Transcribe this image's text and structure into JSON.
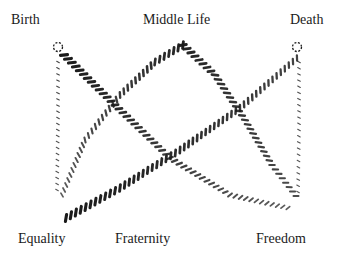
{
  "labels": {
    "birth": "Birth",
    "middle_life": "Middle Life",
    "death": "Death",
    "equality": "Equality",
    "fraternity": "Fraternity",
    "freedom": "Freedom"
  },
  "nodes": [
    {
      "id": "birth",
      "marker": "dotted-circle"
    },
    {
      "id": "death",
      "marker": "dotted-circle"
    }
  ],
  "lines": [
    {
      "id": "birth-vertical",
      "from": "birth",
      "to": "equality",
      "style": "dotted-thin",
      "weight_start": 0.6,
      "weight_end": 0.4
    },
    {
      "id": "birth-to-freedom",
      "from": "birth",
      "to": "freedom",
      "style": "hatched",
      "weight_start": 1.0,
      "weight_end": 0.35
    },
    {
      "id": "equality-to-middle-life",
      "from": "equality",
      "to": "middle_life",
      "style": "hatched",
      "weight_start": 0.35,
      "weight_end": 0.9
    },
    {
      "id": "middle-life-to-freedom",
      "from": "middle_life",
      "to": "freedom",
      "style": "hatched",
      "weight_start": 0.9,
      "weight_end": 0.5
    },
    {
      "id": "equality-to-death",
      "from": "equality",
      "to": "death",
      "style": "hatched",
      "weight_start": 1.0,
      "weight_end": 0.6
    },
    {
      "id": "death-vertical",
      "from": "death",
      "to": "freedom",
      "style": "dotted-thin",
      "weight_start": 0.5,
      "weight_end": 0.4
    }
  ],
  "colors": {
    "ink": "#1a1a1a",
    "background": "#ffffff"
  }
}
